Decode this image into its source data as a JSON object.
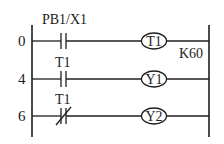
{
  "diagram": {
    "type": "ladder-logic",
    "colors": {
      "ink": "#1e1e1e",
      "background": "#ffffff"
    },
    "rungs": [
      {
        "step": "0",
        "contact": {
          "label": "PB1/X1",
          "kind": "normally-open"
        },
        "coil": {
          "label": "T1",
          "preset": "K60"
        }
      },
      {
        "step": "4",
        "contact": {
          "label": "T1",
          "kind": "normally-open"
        },
        "coil": {
          "label": "Y1"
        }
      },
      {
        "step": "6",
        "contact": {
          "label": "T1",
          "kind": "normally-closed"
        },
        "coil": {
          "label": "Y2"
        }
      }
    ]
  }
}
